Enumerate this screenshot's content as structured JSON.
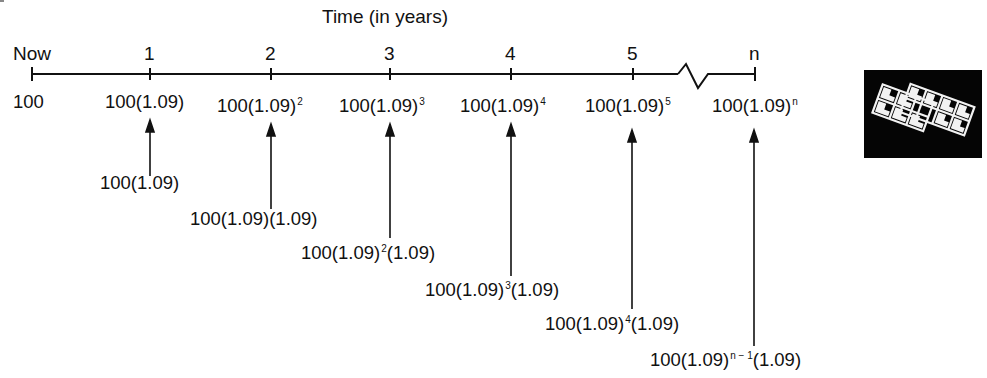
{
  "diagram": {
    "title": "Time (in years)",
    "timeline": {
      "ticks": [
        {
          "label": "Now",
          "x": 32
        },
        {
          "label": "1",
          "x": 150
        },
        {
          "label": "2",
          "x": 271
        },
        {
          "label": "3",
          "x": 390
        },
        {
          "label": "4",
          "x": 511
        },
        {
          "label": "5",
          "x": 633
        },
        {
          "label": "n",
          "x": 755
        }
      ],
      "break_symbol": "zigzag between 5 and n"
    },
    "values_row": [
      {
        "base": "100",
        "exp": ""
      },
      {
        "base": "100(1.09)",
        "exp": ""
      },
      {
        "base": "100(1.09)",
        "exp": "2"
      },
      {
        "base": "100(1.09)",
        "exp": "3"
      },
      {
        "base": "100(1.09)",
        "exp": "4"
      },
      {
        "base": "100(1.09)",
        "exp": "5"
      },
      {
        "base": "100(1.09)",
        "exp": "n"
      }
    ],
    "derivations": [
      {
        "pre": "100(1.09)",
        "exp": "",
        "post": ""
      },
      {
        "pre": "100(1.09)",
        "exp": "",
        "post": "(1.09)"
      },
      {
        "pre": "100(1.09)",
        "exp": "2",
        "post": "(1.09)"
      },
      {
        "pre": "100(1.09)",
        "exp": "3",
        "post": "(1.09)"
      },
      {
        "pre": "100(1.09)",
        "exp": "4",
        "post": "(1.09)"
      },
      {
        "pre": "100(1.09)",
        "exp": "n − 1",
        "post": "(1.09)"
      }
    ],
    "icon": "calculator-grid-icon",
    "colors": {
      "ink": "#111111",
      "background": "#ffffff",
      "icon_bg": "#050505",
      "icon_fg": "#f2f2f2"
    }
  }
}
